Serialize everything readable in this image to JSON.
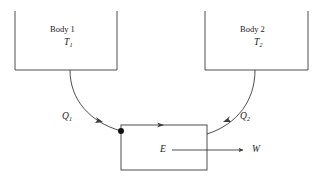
{
  "diagram": {
    "type": "thermodynamic-flow-diagram",
    "stroke_color": "#3a3a3a",
    "text_color": "#1a1a1a",
    "background_color": "#ffffff",
    "bodies": [
      {
        "id": "body-1",
        "name": "Body 1",
        "temperature_symbol": "T",
        "temperature_subscript": "1",
        "box": {
          "x": 15,
          "y": 11,
          "width": 102,
          "height": 59
        }
      },
      {
        "id": "body-2",
        "name": "Body 2",
        "temperature_symbol": "T",
        "temperature_subscript": "2",
        "box": {
          "x": 205,
          "y": 11,
          "width": 103,
          "height": 59
        }
      }
    ],
    "engine": {
      "id": "engine",
      "symbol": "E",
      "box": {
        "x": 121,
        "y": 125,
        "width": 86,
        "height": 45
      }
    },
    "heat_flows": [
      {
        "id": "q1",
        "symbol": "Q",
        "subscript": "1",
        "from": "Body 1",
        "to": "Engine",
        "direction": "into-engine"
      },
      {
        "id": "q2",
        "symbol": "Q",
        "subscript": "2",
        "from": "Body 2",
        "to": "Engine",
        "direction": "into-engine"
      }
    ],
    "work_output": {
      "id": "w",
      "symbol": "W",
      "from": "Engine",
      "direction": "out-of-engine"
    },
    "junction_dot": {
      "x": 121,
      "y": 131,
      "radius": 3
    }
  }
}
